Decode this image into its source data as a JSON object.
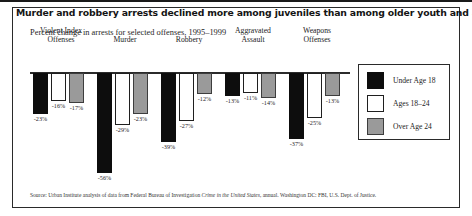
{
  "figure": {
    "title": "Murder and robbery arrests declined more among juveniles than among older youth and adults.",
    "subtitle": "Percent change in arrests for selected offenses, 1995–1999",
    "source_prefix": "Source: Urban Institute analysis of data from Federal Bureau of Investigation ",
    "source_italic": "Crime in the United States",
    "source_suffix": ", annual. Washington DC: FBI, U.S. Dept. of Justice."
  },
  "legend": {
    "items": [
      {
        "label": "Under Age 18",
        "color": "#0d0d0d",
        "swatch": "c-black"
      },
      {
        "label": "Ages 18–24",
        "color": "#ffffff",
        "swatch": "c-white"
      },
      {
        "label": "Over Age 24",
        "color": "#9a9a9a",
        "swatch": "c-gray"
      }
    ]
  },
  "chart_data": {
    "type": "bar",
    "title": "Murder and robbery arrests declined more among juveniles than among older youth and adults.",
    "subtitle": "Percent change in arrests for selected offenses, 1995–1999",
    "xlabel": "",
    "ylabel": "Percent change in arrests",
    "ylim": [
      -60,
      0
    ],
    "grid": false,
    "legend_position": "right",
    "categories": [
      "Violent Index Offenses",
      "Murder",
      "Robbery",
      "Aggravated Assault",
      "Weapons Offenses"
    ],
    "category_lines": [
      [
        "Violent Index",
        "Offenses"
      ],
      [
        "Murder"
      ],
      [
        "Robbery"
      ],
      [
        "Aggravated",
        "Assault"
      ],
      [
        "Weapons",
        "Offenses"
      ]
    ],
    "series": [
      {
        "name": "Under Age 18",
        "color": "#0d0d0d",
        "values": [
          -23,
          -56,
          -39,
          -13,
          -37
        ]
      },
      {
        "name": "Ages 18–24",
        "color": "#ffffff",
        "values": [
          -16,
          -29,
          -27,
          -11,
          -25
        ]
      },
      {
        "name": "Over Age 24",
        "color": "#9a9a9a",
        "values": [
          -17,
          -23,
          -12,
          -14,
          -13
        ]
      }
    ],
    "data_labels": [
      [
        "-23%",
        "-16%",
        "-17%"
      ],
      [
        "-56%",
        "-29%",
        "-23%"
      ],
      [
        "-39%",
        "-27%",
        "-12%"
      ],
      [
        "-13%",
        "-11%",
        "-14%"
      ],
      [
        "-37%",
        "-25%",
        "-13%"
      ]
    ]
  }
}
